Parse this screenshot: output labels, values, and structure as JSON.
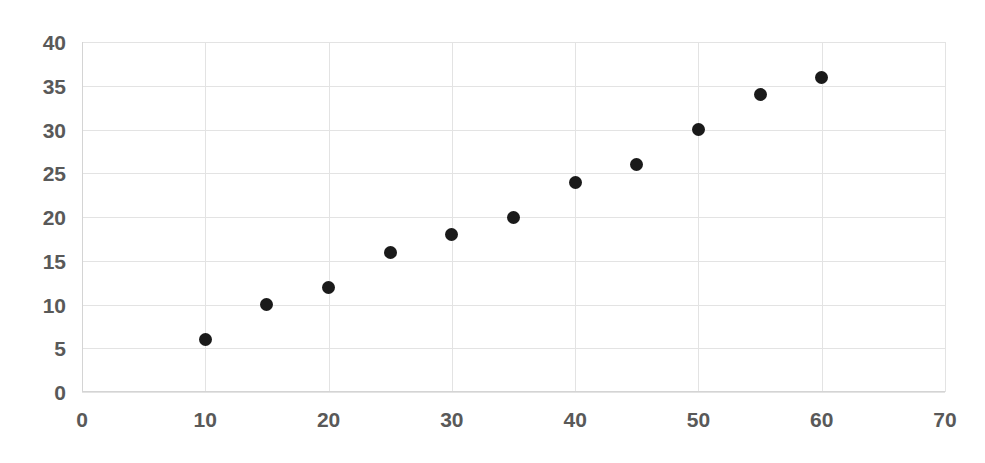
{
  "chart_data": {
    "type": "scatter",
    "title": "",
    "subtitle": "",
    "xlabel": "",
    "ylabel": "",
    "xlim": [
      0,
      70
    ],
    "ylim": [
      0,
      40
    ],
    "xticks": [
      0,
      10,
      20,
      30,
      40,
      50,
      60,
      70
    ],
    "yticks": [
      0,
      5,
      10,
      15,
      20,
      25,
      30,
      35,
      40
    ],
    "xtick_labels": [
      "0",
      "10",
      "20",
      "30",
      "40",
      "50",
      "60",
      "70"
    ],
    "ytick_labels": [
      "0",
      "5",
      "10",
      "15",
      "20",
      "25",
      "30",
      "35",
      "40"
    ],
    "grid": true,
    "grid_color": "#e3e3e3",
    "legend": false,
    "legend_position": "none",
    "marker_color": "#1a1a1a",
    "marker_shape": "circle",
    "marker_size_px": 13,
    "label_color": "#595959",
    "background_color": "#ffffff",
    "x": [
      10,
      15,
      20,
      25,
      30,
      35,
      40,
      45,
      50,
      55,
      60
    ],
    "y": [
      6,
      10,
      12,
      16,
      18,
      20,
      24,
      26,
      30,
      34,
      36
    ],
    "points": [
      {
        "x": 10,
        "y": 6
      },
      {
        "x": 15,
        "y": 10
      },
      {
        "x": 20,
        "y": 12
      },
      {
        "x": 25,
        "y": 16
      },
      {
        "x": 30,
        "y": 18
      },
      {
        "x": 35,
        "y": 20
      },
      {
        "x": 40,
        "y": 24
      },
      {
        "x": 45,
        "y": 26
      },
      {
        "x": 50,
        "y": 30
      },
      {
        "x": 55,
        "y": 34
      },
      {
        "x": 60,
        "y": 36
      }
    ]
  }
}
